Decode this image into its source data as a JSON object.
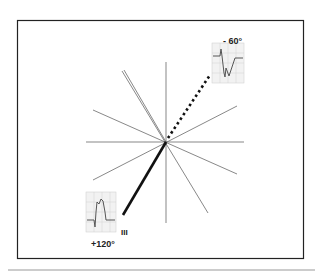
{
  "figure": {
    "type": "hexaxial-reference-diagram",
    "labels": {
      "top_angle": "- 60°",
      "bottom_angle": "+120°",
      "lead": "III"
    },
    "axes_angles_deg": [
      0,
      30,
      60,
      90,
      120,
      150
    ],
    "positive_pole": {
      "angle": 120,
      "style": "solid",
      "label": "+120°"
    },
    "negative_pole": {
      "angle": -60,
      "style": "dotted",
      "label": "- 60°"
    },
    "ecg_insets": [
      {
        "position": "top-right",
        "description": "negative QRS deflection"
      },
      {
        "position": "bottom-left",
        "description": "positive QRS deflection"
      }
    ],
    "colors": {
      "line": "#333333",
      "bold_line": "#111111",
      "frame": "#222222",
      "grid": "#cccccc"
    }
  }
}
